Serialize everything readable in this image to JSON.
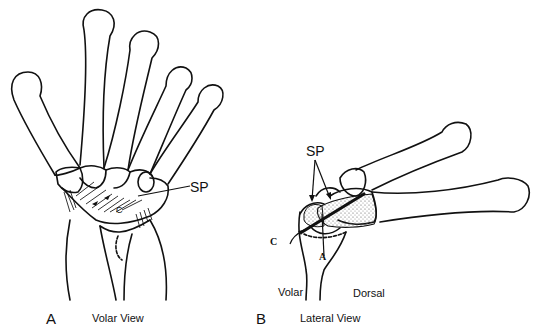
{
  "figure": {
    "panels": [
      {
        "letter": "A",
        "caption": "Volar View",
        "labels": {
          "sp": "SP",
          "c": "C"
        }
      },
      {
        "letter": "B",
        "caption": "Lateral View",
        "labels": {
          "sp": "SP",
          "c": "C",
          "a": "A",
          "volar": "Volar",
          "dorsal": "Dorsal"
        }
      }
    ]
  }
}
